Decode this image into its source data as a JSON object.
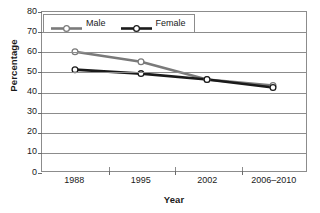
{
  "chart_data": {
    "type": "line",
    "title": "",
    "xlabel": "Year",
    "ylabel": "Percentage",
    "categories": [
      "1988",
      "1995",
      "2002",
      "2006–2010"
    ],
    "series": [
      {
        "name": "Male",
        "values": [
          60,
          55,
          46,
          43
        ],
        "color": "#7a7a7a"
      },
      {
        "name": "Female",
        "values": [
          51,
          49,
          46,
          42
        ],
        "color": "#1a1a1a"
      }
    ],
    "ylim": [
      0,
      80
    ],
    "yticks": [
      0,
      10,
      20,
      30,
      40,
      50,
      60,
      70,
      80
    ],
    "grid": true,
    "legend_position": "top-left-inside",
    "marker": "open-circle"
  },
  "axes": {
    "y_title": "Percentage",
    "x_title": "Year",
    "y_tick_labels": [
      "80",
      "70",
      "60",
      "50",
      "40",
      "30",
      "20",
      "10",
      "0"
    ],
    "x_tick_labels": [
      "1988",
      "1995",
      "2002",
      "2006–2010"
    ]
  },
  "legend": {
    "entries": [
      {
        "label": "Male",
        "icon": "line-marker-gray-icon"
      },
      {
        "label": "Female",
        "icon": "line-marker-black-icon"
      }
    ]
  },
  "colors": {
    "male_line": "#7a7a7a",
    "female_line": "#1a1a1a",
    "grid": "#8c8c8c",
    "frame": "#8c8c8c",
    "marker_fill": "#ffffff",
    "background": "#ffffff"
  }
}
